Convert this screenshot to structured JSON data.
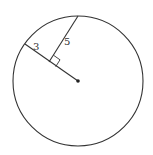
{
  "diagram": {
    "type": "circle-geometry",
    "circle": {
      "cx": 78,
      "cy": 81,
      "r": 65,
      "stroke": "#333333"
    },
    "center_point": {
      "x": 78,
      "y": 81
    },
    "radius_line": {
      "x1": 25,
      "y1": 44,
      "x2": 78,
      "y2": 81
    },
    "chord_segment": {
      "x1": 78,
      "y1": 16,
      "x2": 49,
      "y2": 62
    },
    "right_angle_at": {
      "x": 49,
      "y": 62
    },
    "labels": {
      "segment_outer": "3",
      "segment_chord": "5"
    }
  }
}
